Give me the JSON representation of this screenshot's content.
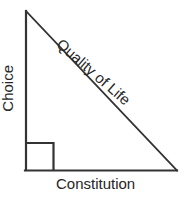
{
  "diagram": {
    "type": "right-triangle",
    "background_color": "#ffffff",
    "stroke_color": "#333333",
    "text_color": "#262626",
    "vertices": {
      "apex": [
        25,
        11
      ],
      "bottom_left": [
        25,
        170
      ],
      "bottom_right": [
        176,
        170
      ]
    },
    "right_angle_marker": {
      "at": "bottom_left",
      "size": 28
    },
    "labels": {
      "vertical_leg": "Choice",
      "base": "Constitution",
      "hypotenuse": "Quality of Life"
    }
  }
}
